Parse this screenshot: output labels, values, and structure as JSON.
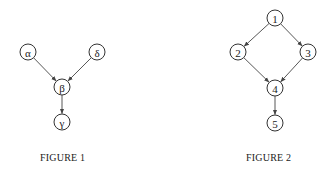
{
  "figures": [
    {
      "caption": "FIGURE 1",
      "nodes": [
        {
          "id": "alpha",
          "label": "α",
          "x": 28,
          "y": 52
        },
        {
          "id": "delta",
          "label": "δ",
          "x": 97,
          "y": 52
        },
        {
          "id": "beta",
          "label": "β",
          "x": 62,
          "y": 87
        },
        {
          "id": "gamma",
          "label": "γ",
          "x": 62,
          "y": 122
        }
      ],
      "edges": [
        {
          "from": "alpha",
          "to": "beta"
        },
        {
          "from": "delta",
          "to": "beta"
        },
        {
          "from": "beta",
          "to": "gamma"
        }
      ]
    },
    {
      "caption": "FIGURE 2",
      "nodes": [
        {
          "id": "n1",
          "label": "1",
          "x": 275,
          "y": 18
        },
        {
          "id": "n2",
          "label": "2",
          "x": 238,
          "y": 52
        },
        {
          "id": "n3",
          "label": "3",
          "x": 308,
          "y": 52
        },
        {
          "id": "n4",
          "label": "4",
          "x": 275,
          "y": 88
        },
        {
          "id": "n5",
          "label": "5",
          "x": 275,
          "y": 123
        }
      ],
      "edges": [
        {
          "from": "n1",
          "to": "n2"
        },
        {
          "from": "n1",
          "to": "n3"
        },
        {
          "from": "n2",
          "to": "n4"
        },
        {
          "from": "n3",
          "to": "n4"
        },
        {
          "from": "n4",
          "to": "n5"
        }
      ]
    }
  ],
  "style": {
    "node_radius": 8,
    "stroke": "#333333",
    "background": "#ffffff"
  }
}
